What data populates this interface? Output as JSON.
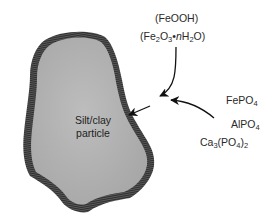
{
  "diagram": {
    "particle_label_line1": "Silt/clay",
    "particle_label_line2": "particle",
    "coating_labels": {
      "oxyhydroxide": "(FeOOH)",
      "hydrous_oxide_parts": [
        "(Fe",
        "2",
        "O",
        "3",
        "•",
        "n",
        "H",
        "2",
        "O)"
      ]
    },
    "phosphate_labels": {
      "iron_phosphate": [
        "FePO",
        "4"
      ],
      "aluminum_phosphate": [
        "AlPO",
        "4"
      ],
      "calcium_phosphate": [
        "Ca",
        "3",
        "(PO",
        "4",
        ")",
        "2"
      ]
    },
    "colors": {
      "particle_fill": "#b4b4b4",
      "coating": "#4a4a4a",
      "arrow": "#111111"
    }
  }
}
